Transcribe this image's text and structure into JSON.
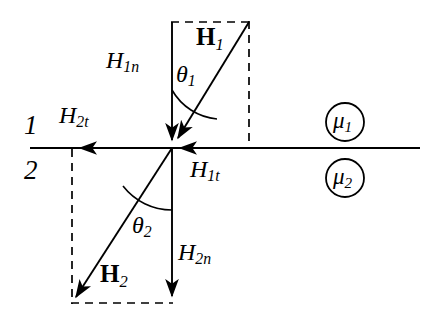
{
  "figure": {
    "type": "physics-vector-diagram",
    "background_color": "#ffffff",
    "line_color": "#000000"
  },
  "labels": {
    "region_1": "1",
    "region_2": "2",
    "mu_1_base": "μ",
    "mu_1_sub": "1",
    "mu_2_base": "μ",
    "mu_2_sub": "2",
    "H1_vector_base": "H",
    "H1_vector_sub": "1",
    "H2_vector_base": "H",
    "H2_vector_sub": "2",
    "H1n_base": "H",
    "H1n_sub": "1n",
    "H1t_base": "H",
    "H1t_sub": "1t",
    "H2n_base": "H",
    "H2n_sub": "2n",
    "H2t_base": "H",
    "H2t_sub": "2t",
    "theta_1_base": "θ",
    "theta_1_sub": "1",
    "theta_2_base": "θ",
    "theta_2_sub": "2"
  },
  "geometry": {
    "origin": {
      "x": 172,
      "y": 148
    },
    "interface_line": {
      "x1": 30,
      "y1": 148,
      "x2": 420,
      "y2": 148
    },
    "H1_ray": {
      "x1": 249,
      "y1": 22,
      "x2": 172,
      "y2": 148
    },
    "H2_ray": {
      "x1": 172,
      "y1": 148,
      "x2": 72,
      "y2": 303
    },
    "H1n_arrow": {
      "x1": 172,
      "y1": 22,
      "x2": 172,
      "y2": 148
    },
    "H2n_arrow": {
      "x1": 172,
      "y1": 148,
      "x2": 172,
      "y2": 303
    },
    "H1t_arrow": {
      "x1": 249,
      "y1": 148,
      "x2": 172,
      "y2": 148
    },
    "H2t_arrow": {
      "x1": 172,
      "y1": 148,
      "x2": 72,
      "y2": 148
    },
    "dashed_top": {
      "x1": 172,
      "y1": 22,
      "x2": 249,
      "y2": 22
    },
    "dashed_right": {
      "x1": 249,
      "y1": 22,
      "x2": 249,
      "y2": 148
    },
    "dashed_bottom": {
      "x1": 72,
      "y1": 303,
      "x2": 172,
      "y2": 303
    },
    "dashed_left": {
      "x1": 72,
      "y1": 148,
      "x2": 72,
      "y2": 303
    },
    "theta_1_arc_radius": 58,
    "theta_2_arc_radius": 62,
    "mu_1_circle": {
      "cx": 345,
      "cy": 122,
      "r": 19
    },
    "mu_2_circle": {
      "cx": 345,
      "cy": 178,
      "r": 19
    }
  }
}
